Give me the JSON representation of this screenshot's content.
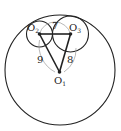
{
  "diagram": {
    "type": "geometry",
    "points": {
      "O1": {
        "label": "O",
        "sub": "1"
      },
      "O2": {
        "label": "O",
        "sub": "2"
      },
      "O3": {
        "label": "O",
        "sub": "3"
      }
    },
    "edges": {
      "O2O3": "7",
      "O2O1": "9",
      "O3O1": "8"
    },
    "colors": {
      "stroke": "#222222",
      "light_arc": "#9a9a9a",
      "background": "#ffffff"
    }
  }
}
